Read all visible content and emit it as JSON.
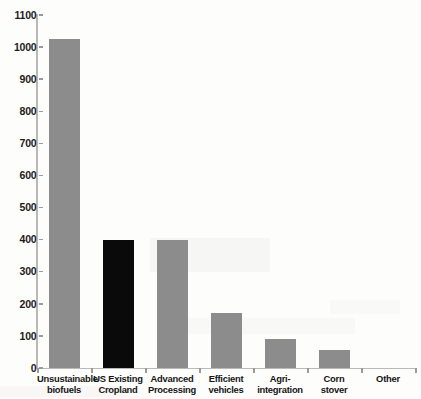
{
  "chart_data": {
    "type": "bar",
    "title": "",
    "subtitle": "",
    "xlabel": "",
    "ylabel": "",
    "ylim": [
      0,
      1100
    ],
    "ytick_step": 100,
    "yticks": [
      0,
      100,
      200,
      300,
      400,
      500,
      600,
      700,
      800,
      900,
      1000,
      1100
    ],
    "ytick_labels": [
      "0",
      "100",
      "200",
      "300",
      "400",
      "500",
      "600",
      "700",
      "800",
      "900",
      "1000",
      "1100"
    ],
    "grid": false,
    "legend": "none",
    "categories": [
      "Unsustainable biofuels",
      "US Existing Cropland",
      "Advanced Processing",
      "Efficient vehicles",
      "Agri-integration",
      "Corn stover",
      "Other"
    ],
    "category_lines": [
      [
        "Unsustainable",
        "biofuels"
      ],
      [
        "US Existing",
        "Cropland"
      ],
      [
        "Advanced",
        "Processing"
      ],
      [
        "Efficient",
        "vehicles"
      ],
      [
        "Agri-",
        "integration"
      ],
      [
        "Corn",
        "stover"
      ],
      [
        "Other"
      ]
    ],
    "values": [
      1025,
      400,
      400,
      170,
      90,
      55,
      0
    ],
    "bar_colors": [
      "#8c8c8c",
      "#0a0a0a",
      "#8c8c8c",
      "#8c8c8c",
      "#8c8c8c",
      "#8c8c8c",
      "#8c8c8c"
    ],
    "series": [
      {
        "name": "",
        "values": [
          1025,
          400,
          400,
          170,
          90,
          55,
          0
        ]
      }
    ]
  },
  "style": {
    "accent_gray": "#8c8c8c",
    "highlight_black": "#0a0a0a",
    "axis_color": "#b9b9b7",
    "tick_color": "#9a9a98",
    "text_color": "#151515",
    "background": "#fdfdfc"
  }
}
